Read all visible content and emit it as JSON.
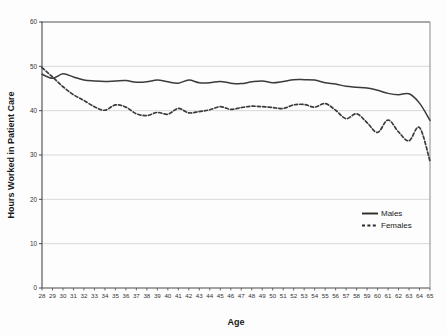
{
  "chart_data": {
    "type": "line",
    "title": "",
    "xlabel": "Age",
    "ylabel": "Hours Worked in Patient Care",
    "xlim": [
      28,
      65
    ],
    "ylim": [
      0,
      60
    ],
    "yticks": [
      0,
      10,
      20,
      30,
      40,
      50,
      60
    ],
    "grid": true,
    "legend_position": "bottom-right",
    "x": [
      28,
      29,
      30,
      31,
      32,
      33,
      34,
      35,
      36,
      37,
      38,
      39,
      40,
      41,
      42,
      43,
      44,
      45,
      46,
      47,
      48,
      49,
      50,
      51,
      52,
      53,
      54,
      55,
      56,
      57,
      58,
      59,
      60,
      61,
      62,
      63,
      64,
      65
    ],
    "categories": [
      "28",
      "29",
      "30",
      "31",
      "32",
      "33",
      "34",
      "35",
      "36",
      "37",
      "38",
      "39",
      "40",
      "41",
      "42",
      "43",
      "44",
      "45",
      "46",
      "47",
      "48",
      "49",
      "50",
      "51",
      "52",
      "53",
      "54",
      "55",
      "56",
      "57",
      "58",
      "59",
      "60",
      "61",
      "62",
      "63",
      "64",
      "65"
    ],
    "series": [
      {
        "name": "Males",
        "style": "solid",
        "color": "#3b3b3b",
        "values": [
          48.2,
          47.3,
          48.3,
          47.6,
          46.9,
          46.7,
          46.6,
          46.7,
          46.8,
          46.4,
          46.5,
          46.9,
          46.5,
          46.2,
          46.9,
          46.3,
          46.3,
          46.6,
          46.2,
          46.1,
          46.5,
          46.7,
          46.3,
          46.6,
          47.0,
          47.0,
          46.9,
          46.3,
          46.0,
          45.5,
          45.3,
          45.1,
          44.6,
          43.9,
          43.6,
          43.8,
          41.7,
          37.8
        ]
      },
      {
        "name": "Females",
        "style": "dashed",
        "color": "#3b3b3b",
        "values": [
          49.7,
          47.6,
          45.4,
          43.6,
          42.3,
          40.9,
          40.1,
          41.3,
          40.8,
          39.3,
          38.9,
          39.6,
          39.2,
          40.5,
          39.5,
          39.8,
          40.2,
          40.9,
          40.3,
          40.7,
          41.0,
          40.9,
          40.7,
          40.5,
          41.3,
          41.4,
          40.8,
          41.6,
          40.1,
          38.2,
          39.3,
          37.3,
          35.1,
          37.9,
          35.2,
          33.2,
          36.2,
          28.6
        ]
      }
    ]
  },
  "legend": {
    "items": [
      {
        "label": "Males",
        "style": "solid"
      },
      {
        "label": "Females",
        "style": "dashed"
      }
    ]
  }
}
